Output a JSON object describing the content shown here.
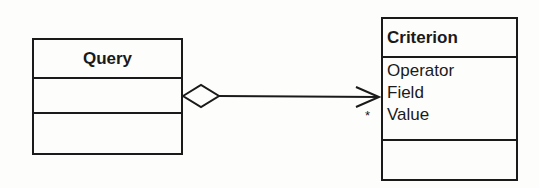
{
  "classes": {
    "query": {
      "name": "Query",
      "attributes": [],
      "operations": []
    },
    "criterion": {
      "name": "Criterion",
      "attributes": [
        "Operator",
        "Field",
        "Value"
      ],
      "operations": []
    }
  },
  "association": {
    "type": "aggregation",
    "source": "Query",
    "target": "Criterion",
    "navigable": "to-target",
    "target_multiplicity": "*"
  },
  "colors": {
    "line": "#1a1a1a",
    "background": "#fdfdfc"
  }
}
